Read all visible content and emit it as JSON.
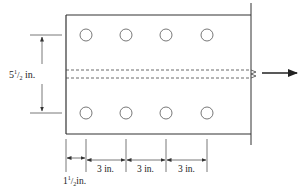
{
  "diagram": {
    "type": "bolted tension plate with two rows of four bolt holes",
    "plate": {
      "left": 66,
      "top": 15,
      "right": 251,
      "bottom": 134,
      "stroke": "#333333"
    },
    "holes": {
      "radius": 6,
      "rows_y": [
        35,
        113
      ],
      "cols_x": [
        86,
        126,
        166,
        207
      ]
    },
    "centerline_dashes": {
      "y_top": 70,
      "y_bottom": 78
    },
    "load_arrow": {
      "x1": 262,
      "x2": 297,
      "y": 73
    },
    "dimensions": {
      "vertical": {
        "label_main": "5",
        "label_sup": "1",
        "label_sub": "2",
        "label_unit": " in.",
        "full": "5 1/2 in."
      },
      "edge": {
        "label_main": "1",
        "label_sup": "1",
        "label_sub": "2",
        "label_unit": "in.",
        "full": "1 1/2 in."
      },
      "pitch": [
        {
          "label": "3 in."
        },
        {
          "label": "3 in."
        },
        {
          "label": "3 in."
        }
      ]
    }
  }
}
